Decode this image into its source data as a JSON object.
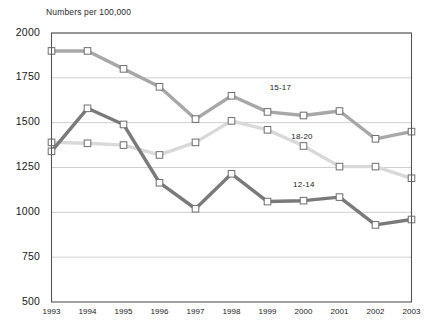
{
  "chart_data": {
    "type": "line",
    "title": "",
    "ylabel": "Numbers per 100,000",
    "xlabel": "",
    "categories": [
      "1993",
      "1994",
      "1995",
      "1996",
      "1997",
      "1998",
      "1999",
      "2000",
      "2001",
      "2002",
      "2003"
    ],
    "x": [
      1993,
      1994,
      1995,
      1996,
      1997,
      1998,
      1999,
      2000,
      2001,
      2002,
      2003
    ],
    "ylim": [
      500,
      2000
    ],
    "yticks": [
      500,
      750,
      1000,
      1250,
      1500,
      1750,
      2000
    ],
    "ytick_labels": [
      "500",
      "750",
      "1000",
      "1250",
      "1500",
      "1750",
      "2000"
    ],
    "grid": "horizontal",
    "legend_position": "inline-labels",
    "series": [
      {
        "name": "15-17",
        "color": "#a8a8a8",
        "label_text": "15-17",
        "values": [
          1900,
          1900,
          1800,
          1700,
          1520,
          1650,
          1560,
          1540,
          1565,
          1410,
          1450
        ]
      },
      {
        "name": "18-20",
        "color": "#d9d9d9",
        "label_text": "18-20",
        "values": [
          1390,
          1385,
          1375,
          1320,
          1390,
          1510,
          1460,
          1370,
          1255,
          1255,
          1190
        ]
      },
      {
        "name": "12-14",
        "color": "#7a7a7a",
        "label_text": "12-14",
        "values": [
          1340,
          1580,
          1490,
          1165,
          1020,
          1215,
          1060,
          1065,
          1085,
          930,
          960
        ]
      }
    ],
    "annotations": [
      {
        "text": "15-17",
        "x": 1999.45,
        "y": 1690
      },
      {
        "text": "18-20",
        "x": 2000.05,
        "y": 1420
      },
      {
        "text": "12-14",
        "x": 2000.1,
        "y": 1150
      }
    ]
  },
  "axes": {
    "frame_color": "#555555",
    "grid_color": "#d0d0d0",
    "marker_fill": "#ffffff",
    "marker_stroke": "#6e6e6e"
  }
}
